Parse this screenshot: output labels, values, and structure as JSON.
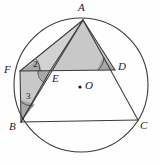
{
  "figure": {
    "kind": "circle-geometry-diagram",
    "canvas": {
      "width": 160,
      "height": 165
    },
    "background_color": "#fefefe",
    "stroke_color": "#3a3a3a",
    "fill_color": "#c8c8c8",
    "fill_color_light": "#d2d2d2",
    "wedge_fill_color": "#a8a8a8",
    "label_color": "#1a1a1a"
  },
  "circle": {
    "name": "circumscribed-circle",
    "center_label": "O",
    "cx": 81,
    "cy": 85,
    "r": 67
  },
  "points": [
    {
      "id": "A",
      "label": "A",
      "x": 83,
      "y": 20,
      "label_x": 78,
      "label_y": 2
    },
    {
      "id": "F",
      "label": "F",
      "x": 20,
      "y": 71,
      "label_x": 4,
      "label_y": 64
    },
    {
      "id": "E",
      "label": "E",
      "x": 50,
      "y": 71,
      "label_x": 52,
      "label_y": 73
    },
    {
      "id": "D",
      "label": "D",
      "x": 115,
      "y": 70,
      "label_x": 118,
      "label_y": 61
    },
    {
      "id": "B",
      "label": "B",
      "x": 21,
      "y": 122,
      "label_x": 9,
      "label_y": 121
    },
    {
      "id": "C",
      "label": "C",
      "x": 138,
      "y": 120,
      "label_x": 140,
      "label_y": 120
    },
    {
      "id": "O",
      "label": "O",
      "x": 80,
      "y": 87,
      "label_x": 85,
      "label_y": 80
    }
  ],
  "segments": [
    {
      "id": "AF",
      "from": "A",
      "to": "F",
      "x1": 83,
      "y1": 20,
      "x2": 20,
      "y2": 71
    },
    {
      "id": "AE",
      "from": "A",
      "to": "E",
      "x1": 83,
      "y1": 20,
      "x2": 50,
      "y2": 71
    },
    {
      "id": "AD",
      "from": "A",
      "to": "D",
      "x1": 83,
      "y1": 20,
      "x2": 115,
      "y2": 70
    },
    {
      "id": "AC",
      "from": "A",
      "to": "C",
      "x1": 83,
      "y1": 20,
      "x2": 138,
      "y2": 120
    },
    {
      "id": "FD",
      "from": "F",
      "to": "D",
      "x1": 20,
      "y1": 71,
      "x2": 115,
      "y2": 70
    },
    {
      "id": "FB",
      "from": "F",
      "to": "B",
      "x1": 20,
      "y1": 71,
      "x2": 21,
      "y2": 122
    },
    {
      "id": "BE",
      "from": "B",
      "to": "E",
      "x1": 21,
      "y1": 122,
      "x2": 50,
      "y2": 71
    },
    {
      "id": "BA",
      "from": "B",
      "to": "A",
      "x1": 21,
      "y1": 122,
      "x2": 83,
      "y2": 20
    },
    {
      "id": "BC",
      "from": "B",
      "to": "C",
      "x1": 21,
      "y1": 122,
      "x2": 138,
      "y2": 120
    }
  ],
  "shaded_regions": [
    {
      "id": "AFE",
      "name": "triangle-a-f-e",
      "points": "83,20 20,71 50,71",
      "shade": "light"
    },
    {
      "id": "AED",
      "name": "triangle-a-e-d",
      "points": "83,20 50,71 115,70",
      "shade": "normal"
    },
    {
      "id": "FBE",
      "name": "triangle-f-b-e",
      "points": "20,71 21,122 50,71",
      "shade": "normal"
    }
  ],
  "angle_marks": [
    {
      "id": "angle2",
      "label": "2",
      "at_point": "F",
      "name": "angle-2-at-f",
      "label_x": 33,
      "label_y": 60,
      "wedge": "20,71 42,71 38,60",
      "arc": "M 40,71 A 20,20 0 0 0 36,59"
    },
    {
      "id": "angle3",
      "label": "3",
      "at_point": "B",
      "name": "angle-3-at-b",
      "label_x": 26,
      "label_y": 92,
      "wedge": "21,122 21,100 35,104",
      "arc": "M 21,102 A 20,20 0 0 0 33,106"
    },
    {
      "id": "angleE",
      "label": "",
      "at_point": "E",
      "name": "angle-at-e",
      "label_x": 0,
      "label_y": 0,
      "wedge": "50,71 37,71 44,84",
      "arc": "M 38,71 A 13,13 0 0 0 43,82"
    },
    {
      "id": "angleD",
      "label": "",
      "at_point": "D",
      "name": "angle-at-d",
      "label_x": 0,
      "label_y": 0,
      "wedge": "115,70 97,70 103,57",
      "arc": "M 98,70 A 18,18 0 0 0 104,57"
    }
  ],
  "center_dot": {
    "name": "circle-center-dot",
    "cx": 80,
    "cy": 87,
    "r": 1.6
  }
}
